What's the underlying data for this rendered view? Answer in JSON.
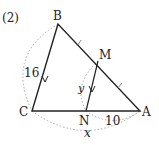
{
  "problem_label": "(2)",
  "points": {
    "B": {
      "label": "B",
      "x": 58,
      "y": 24
    },
    "C": {
      "label": "C",
      "x": 32,
      "y": 111
    },
    "A": {
      "label": "A",
      "x": 140,
      "y": 111
    },
    "M": {
      "label": "M",
      "x": 98,
      "y": 61
    },
    "N": {
      "label": "N",
      "x": 86,
      "y": 111
    }
  },
  "measurements": {
    "BC": "16",
    "NA": "10",
    "MN": "y",
    "CA": "x"
  },
  "colors": {
    "line": "#222222",
    "dotted": "#aaaaaa"
  }
}
